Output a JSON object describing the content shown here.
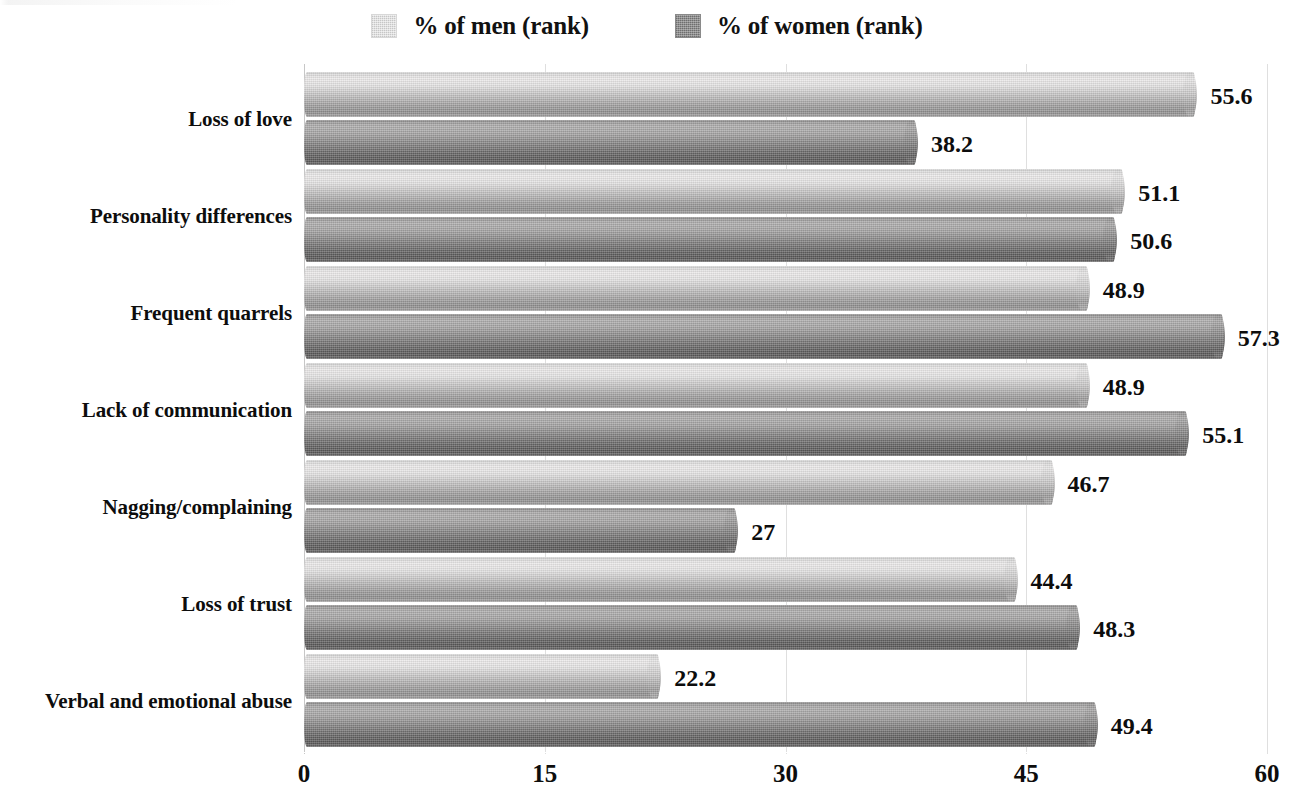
{
  "chart_data": {
    "type": "bar",
    "orientation": "horizontal",
    "title": "",
    "subtitle": "",
    "xlabel": "",
    "ylabel": "",
    "xlim": [
      0,
      60
    ],
    "xticks": [
      0,
      15,
      30,
      45,
      60
    ],
    "xtick_labels": [
      "0",
      "15",
      "30",
      "45",
      "60"
    ],
    "grid": true,
    "grid_axis": "x",
    "legend_position": "top-center",
    "categories": [
      "Loss of love",
      "Personality differences",
      "Frequent quarrels",
      "Lack of communication",
      "Nagging/complaining",
      "Loss of trust",
      "Verbal and emotional abuse"
    ],
    "series": [
      {
        "name": "% of men (rank)",
        "color": "#c6c6c6",
        "values": [
          55.6,
          51.1,
          48.9,
          48.9,
          46.7,
          44.4,
          22.2
        ],
        "value_labels": [
          "55.6",
          "51.1",
          "48.9",
          "48.9",
          "46.7",
          "44.4",
          "22.2"
        ]
      },
      {
        "name": "% of women (rank)",
        "color": "#6e6e6e",
        "values": [
          38.2,
          50.6,
          57.3,
          55.1,
          27.0,
          48.3,
          49.4
        ],
        "value_labels": [
          "38.2",
          "50.6",
          "57.3",
          "55.1",
          "27",
          "48.3",
          "49.4"
        ]
      }
    ]
  },
  "legend": {
    "items": [
      {
        "label": "% of men (rank)",
        "swatch": "men-legend-swatch"
      },
      {
        "label": "% of women (rank)",
        "swatch": "women-legend-swatch"
      }
    ]
  },
  "colors": {
    "men_bar": "#c6c6c6",
    "women_bar": "#6e6e6e",
    "text": "#0d0d0d",
    "gridline": "#d9d9d9",
    "background": "#ffffff"
  }
}
